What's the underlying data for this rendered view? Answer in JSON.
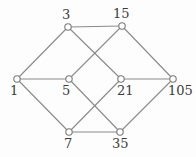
{
  "figure": {
    "kind": "hasse-diagram",
    "background_color": "#fdfdfd",
    "edge_color": "#8a8a8a",
    "node_stroke_color": "#7a7a7a",
    "node_fill_color": "#fdfdfd",
    "label_color": "#3c3c3c",
    "node_radius": 3.2,
    "edge_width": 1.1
  },
  "chart_data": {
    "type": "diagram",
    "title": "",
    "nodes": [
      {
        "id": "n1",
        "label": "1",
        "x": 17,
        "y": 79,
        "label_x": 10,
        "label_y": 84
      },
      {
        "id": "n3",
        "label": "3",
        "x": 68,
        "y": 27,
        "label_x": 62,
        "label_y": 8
      },
      {
        "id": "n15",
        "label": "15",
        "x": 122,
        "y": 26,
        "label_x": 113,
        "label_y": 7
      },
      {
        "id": "n5",
        "label": "5",
        "x": 69,
        "y": 79,
        "label_x": 62,
        "label_y": 84
      },
      {
        "id": "n21",
        "label": "21",
        "x": 121,
        "y": 79,
        "label_x": 117,
        "label_y": 84
      },
      {
        "id": "n105",
        "label": "105",
        "x": 173,
        "y": 79,
        "label_x": 168,
        "label_y": 84
      },
      {
        "id": "n7",
        "label": "7",
        "x": 69,
        "y": 132,
        "label_x": 64,
        "label_y": 137
      },
      {
        "id": "n35",
        "label": "35",
        "x": 120,
        "y": 132,
        "label_x": 112,
        "label_y": 137
      }
    ],
    "edges": [
      {
        "from": "n1",
        "to": "n3"
      },
      {
        "from": "n1",
        "to": "n5"
      },
      {
        "from": "n1",
        "to": "n7"
      },
      {
        "from": "n3",
        "to": "n15"
      },
      {
        "from": "n3",
        "to": "n21"
      },
      {
        "from": "n5",
        "to": "n15"
      },
      {
        "from": "n5",
        "to": "n35"
      },
      {
        "from": "n7",
        "to": "n21"
      },
      {
        "from": "n7",
        "to": "n35"
      },
      {
        "from": "n15",
        "to": "n105"
      },
      {
        "from": "n21",
        "to": "n105"
      },
      {
        "from": "n35",
        "to": "n105"
      }
    ]
  }
}
